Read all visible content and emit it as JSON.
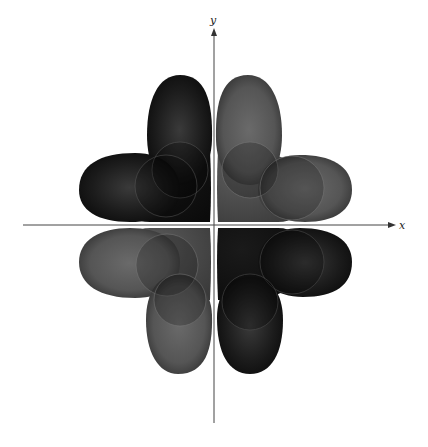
{
  "figure": {
    "type": "orbital-lobes-diagram",
    "axes": {
      "x_label": "x",
      "y_label": "y",
      "origin": [
        214,
        225
      ]
    },
    "colors": {
      "dark_lobe": "#1b1b1b",
      "light_lobe": "#5a5a5a",
      "axis": "#444444",
      "background": "#ffffff"
    },
    "quadrants": [
      {
        "name": "upper-left",
        "shade": "dark"
      },
      {
        "name": "upper-right",
        "shade": "light"
      },
      {
        "name": "lower-left",
        "shade": "light"
      },
      {
        "name": "lower-right",
        "shade": "dark"
      }
    ]
  }
}
